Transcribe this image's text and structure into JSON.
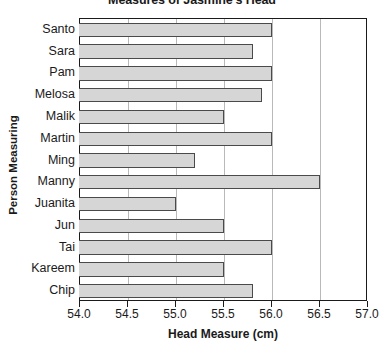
{
  "chart_data": {
    "type": "bar",
    "orientation": "horizontal",
    "title": "Measures of Jasmine's Head",
    "xlabel": "Head Measure (cm)",
    "ylabel": "Person Measuring",
    "categories": [
      "Santo",
      "Sara",
      "Pam",
      "Melosa",
      "Malik",
      "Martin",
      "Ming",
      "Manny",
      "Juanita",
      "Jun",
      "Tai",
      "Kareem",
      "Chip"
    ],
    "values": [
      56.0,
      55.8,
      56.0,
      55.9,
      55.5,
      56.0,
      55.2,
      56.5,
      55.0,
      55.5,
      56.0,
      55.5,
      55.8
    ],
    "xlim": [
      54.0,
      57.0
    ],
    "xticks": [
      54.0,
      54.5,
      55.0,
      55.5,
      56.0,
      56.5,
      57.0
    ],
    "xtick_labels": [
      "54.0",
      "54.5",
      "55.0",
      "55.5",
      "56.0",
      "56.5",
      "57.0"
    ],
    "grid": "vertical",
    "legend": null,
    "bar_color": "#d6d6d6",
    "bar_border_color": "#4a4a4a",
    "gridline_color": "#b9b9b9",
    "axis_color": "#1a1a1a"
  }
}
